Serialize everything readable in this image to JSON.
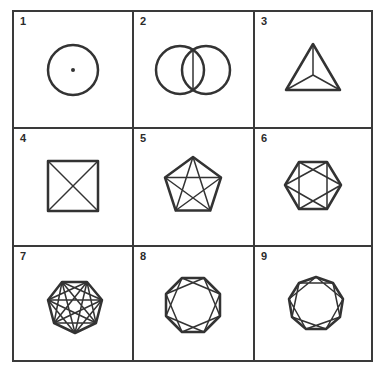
{
  "figure": {
    "cells": [
      {
        "label": "1",
        "shape": "circle-with-center-dot"
      },
      {
        "label": "2",
        "shape": "two-overlapping-circles-with-chord"
      },
      {
        "label": "3",
        "shape": "triangle-with-center-spokes"
      },
      {
        "label": "4",
        "shape": "square-with-diagonals"
      },
      {
        "label": "5",
        "shape": "pentagon-with-all-diagonals"
      },
      {
        "label": "6",
        "shape": "hexagon-with-diagonals"
      },
      {
        "label": "7",
        "shape": "heptagon-with-diagonals"
      },
      {
        "label": "8",
        "shape": "octagon-with-diagonals"
      },
      {
        "label": "9",
        "shape": "nonagon-with-diagonals"
      }
    ],
    "colors": {
      "line": "#333333",
      "border": "#3a3a3a",
      "background": "#ffffff"
    }
  }
}
